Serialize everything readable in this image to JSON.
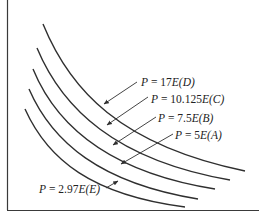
{
  "diagram": {
    "type": "isoquant-curves",
    "curves": [
      {
        "id": "D",
        "label_var": "P",
        "label_eq": " = 17",
        "label_e": "E",
        "label_tag": "(D)",
        "full_label": "P = 17E(D)"
      },
      {
        "id": "C",
        "label_var": "P",
        "label_eq": " = 10.125",
        "label_e": "E",
        "label_tag": "(C)",
        "full_label": "P = 10.125E(C)"
      },
      {
        "id": "B",
        "label_var": "P",
        "label_eq": " = 7.5",
        "label_e": "E",
        "label_tag": "(B)",
        "full_label": "P = 7.5E(B)"
      },
      {
        "id": "A",
        "label_var": "P",
        "label_eq": " = 5",
        "label_e": "E",
        "label_tag": "(A)",
        "full_label": "P = 5E(A)"
      },
      {
        "id": "E",
        "label_var": "P",
        "label_eq": " = 2.97",
        "label_e": "E",
        "label_tag": "(E)",
        "full_label": "P = 2.97E(E)"
      }
    ],
    "colors": {
      "line": "#2f2f2f",
      "background": "#ffffff"
    }
  }
}
